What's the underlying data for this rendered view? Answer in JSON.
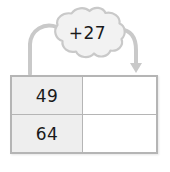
{
  "worksheet": {
    "title": "Addition rule function table",
    "background_color": "#ffffff"
  },
  "rule_bubble": {
    "shape": "cloud",
    "label": "+27",
    "operator": "+",
    "operand": 27,
    "fill_color": "#f2f2f2",
    "stroke_color": "#c9c9c9",
    "text_color": "#1a1a1a"
  },
  "arrows": {
    "stroke_color": "#c9c9c9",
    "left": {
      "name": "input-arrow",
      "label": "",
      "has_arrowhead": false,
      "direction": "down"
    },
    "right": {
      "name": "output-arrow",
      "label": "",
      "has_arrowhead": true,
      "direction": "down"
    }
  },
  "table": {
    "border_color": "#b5b5b5",
    "input_column_fill": "#eeeeee",
    "output_column_fill": "#ffffff",
    "headers": [
      "",
      ""
    ],
    "rows": [
      {
        "input": "49",
        "output": ""
      },
      {
        "input": "64",
        "output": ""
      }
    ]
  }
}
